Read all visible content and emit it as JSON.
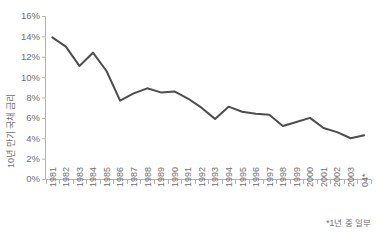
{
  "chart_data": {
    "type": "line",
    "title": "",
    "xlabel": "",
    "ylabel": "10년 만기 국채 금리",
    "ylim": [
      0,
      16
    ],
    "ytick_labels": [
      "0%",
      "2%",
      "4%",
      "6%",
      "8%",
      "10%",
      "12%",
      "14%",
      "16%"
    ],
    "ytick_values": [
      0,
      2,
      4,
      6,
      8,
      10,
      12,
      14,
      16
    ],
    "grid": false,
    "legend": "none",
    "line_color": "#4d4d4d",
    "axis_color": "#b3b3b3",
    "text_color": "#6e6e6e",
    "categories": [
      "1981",
      "1982",
      "1983",
      "1984",
      "1985",
      "1986",
      "1987",
      "1988",
      "1989",
      "1990",
      "1991",
      "1992",
      "1993",
      "1994",
      "1995",
      "1996",
      "1997",
      "1998",
      "1999",
      "2000",
      "2001",
      "2002",
      "2003",
      "04*"
    ],
    "values": [
      13.9,
      13.0,
      11.1,
      12.4,
      10.6,
      7.7,
      8.4,
      8.9,
      8.5,
      8.6,
      7.9,
      7.0,
      5.9,
      7.1,
      6.6,
      6.4,
      6.3,
      5.2,
      5.6,
      6.0,
      5.0,
      4.6,
      4.0,
      4.3
    ],
    "footnote": "*1년 중 일부"
  }
}
